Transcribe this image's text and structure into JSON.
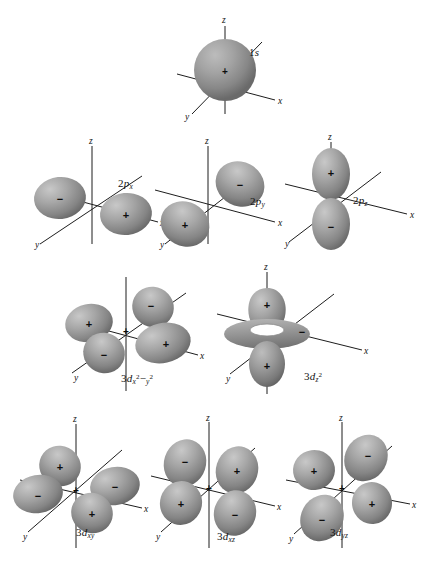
{
  "figure": {
    "background_color": "#ffffff",
    "lobe_fill_light": "#b4b4b4",
    "lobe_fill_dark": "#6e6e6e",
    "axis_color": "#1d1d1d",
    "text_color": "#141414"
  },
  "axis_labels": {
    "x": "x",
    "y": "y",
    "z": "z"
  },
  "signs": {
    "positive": "+",
    "negative": "−"
  },
  "orbitals": [
    {
      "id": "1s",
      "label_main": "1",
      "label_italic": "s",
      "label_sub": "",
      "label_sup": "",
      "label_plain": "1s",
      "row": 1,
      "lobes": [
        {
          "name": "sphere",
          "sign": "+"
        }
      ]
    },
    {
      "id": "2px",
      "label_main": "2",
      "label_italic": "p",
      "label_sub": "x",
      "label_sup": "",
      "label_plain": "2px",
      "row": 2,
      "lobes": [
        {
          "name": "left-lobe",
          "sign": "−"
        },
        {
          "name": "right-lobe",
          "sign": "+"
        }
      ]
    },
    {
      "id": "2py",
      "label_main": "2",
      "label_italic": "p",
      "label_sub": "y",
      "label_sup": "",
      "label_plain": "2py",
      "row": 2,
      "lobes": [
        {
          "name": "upper-right-lobe",
          "sign": "−"
        },
        {
          "name": "lower-left-lobe",
          "sign": "+"
        }
      ]
    },
    {
      "id": "2pz",
      "label_main": "2",
      "label_italic": "p",
      "label_sub": "z",
      "label_sup": "",
      "label_plain": "2pz",
      "row": 2,
      "lobes": [
        {
          "name": "top-lobe",
          "sign": "+"
        },
        {
          "name": "bottom-lobe",
          "sign": "−"
        }
      ]
    },
    {
      "id": "3dx2-y2",
      "label_main": "3",
      "label_italic": "d",
      "label_sub": "x",
      "label_sup": "2",
      "label_plain": "3dx2−y2",
      "row": 3,
      "lobes": [
        {
          "name": "left-lobe",
          "sign": "+"
        },
        {
          "name": "front-lobe",
          "sign": "−"
        },
        {
          "name": "back-lobe",
          "sign": "−"
        },
        {
          "name": "right-lobe",
          "sign": "+"
        }
      ]
    },
    {
      "id": "3dz2",
      "label_main": "3",
      "label_italic": "d",
      "label_sub": "z",
      "label_sup": "2",
      "label_plain": "3dz2",
      "row": 3,
      "lobes": [
        {
          "name": "top-lobe",
          "sign": "+"
        },
        {
          "name": "bottom-lobe",
          "sign": "+"
        },
        {
          "name": "torus",
          "sign": "−"
        }
      ]
    },
    {
      "id": "3dxy",
      "label_main": "3",
      "label_italic": "d",
      "label_sub": "xy",
      "label_sup": "",
      "label_plain": "3dxy",
      "row": 4,
      "lobes": [
        {
          "name": "back-lobe",
          "sign": "+"
        },
        {
          "name": "left-lobe",
          "sign": "−"
        },
        {
          "name": "right-lobe",
          "sign": "−"
        },
        {
          "name": "front-lobe",
          "sign": "+"
        }
      ]
    },
    {
      "id": "3dxz",
      "label_main": "3",
      "label_italic": "d",
      "label_sub": "xz",
      "label_sup": "",
      "label_plain": "3dxz",
      "row": 4,
      "lobes": [
        {
          "name": "upper-left-lobe",
          "sign": "−"
        },
        {
          "name": "upper-right-lobe",
          "sign": "+"
        },
        {
          "name": "lower-left-lobe",
          "sign": "+"
        },
        {
          "name": "lower-right-lobe",
          "sign": "−"
        }
      ]
    },
    {
      "id": "3dyz",
      "label_main": "3",
      "label_italic": "d",
      "label_sub": "yz",
      "label_sup": "",
      "label_plain": "3dyz",
      "row": 4,
      "lobes": [
        {
          "name": "upper-left-lobe",
          "sign": "+"
        },
        {
          "name": "upper-right-lobe",
          "sign": "−"
        },
        {
          "name": "lower-left-lobe",
          "sign": "−"
        },
        {
          "name": "lower-right-lobe",
          "sign": "+"
        }
      ]
    }
  ],
  "labels": {
    "s1": "1s",
    "p2x": "2p",
    "p2y": "2p",
    "p2z": "2p",
    "d3x2y2": "3d",
    "d3z2": "3d",
    "d3xy": "3d",
    "d3xz": "3d",
    "d3yz": "3d"
  }
}
